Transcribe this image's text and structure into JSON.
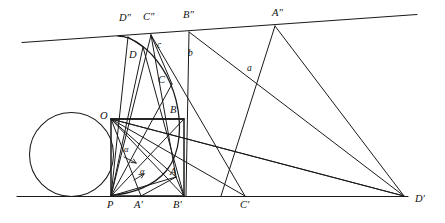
{
  "figure": {
    "type": "geometric-construction",
    "width": 445,
    "height": 223,
    "stroke_color": "#1a1a1a",
    "background_color": "#ffffff"
  },
  "labels": {
    "points": [
      {
        "id": "O",
        "text": "O",
        "x": 100,
        "y": 111
      },
      {
        "id": "P",
        "text": "P",
        "x": 107,
        "y": 200
      },
      {
        "id": "A",
        "text": "A",
        "x": 170,
        "y": 167
      },
      {
        "id": "B",
        "text": "B",
        "x": 170,
        "y": 105
      },
      {
        "id": "C",
        "text": "C",
        "x": 158,
        "y": 75
      },
      {
        "id": "D",
        "text": "D",
        "x": 129,
        "y": 50
      },
      {
        "id": "Ap",
        "text": "A′",
        "x": 134,
        "y": 200
      },
      {
        "id": "Bp",
        "text": "B′",
        "x": 173,
        "y": 200
      },
      {
        "id": "Cp",
        "text": "C′",
        "x": 240,
        "y": 200
      },
      {
        "id": "Dp",
        "text": "D′",
        "x": 415,
        "y": 194
      },
      {
        "id": "App",
        "text": "A″",
        "x": 272,
        "y": 8
      },
      {
        "id": "Bpp",
        "text": "B″",
        "x": 183,
        "y": 10
      },
      {
        "id": "Cpp",
        "text": "C″",
        "x": 143,
        "y": 12
      },
      {
        "id": "Dpp",
        "text": "D″",
        "x": 119,
        "y": 13
      }
    ],
    "sides": [
      {
        "id": "a",
        "text": "a",
        "x": 247,
        "y": 64
      },
      {
        "id": "b",
        "text": "b",
        "x": 188,
        "y": 49
      },
      {
        "id": "c",
        "text": "c",
        "x": 157,
        "y": 41
      }
    ],
    "angles": [
      {
        "id": "alpha-upper",
        "text": "α",
        "x": 124,
        "y": 145
      },
      {
        "id": "alpha-lower",
        "text": "α",
        "x": 140,
        "y": 167
      }
    ]
  },
  "geometry": {
    "baseline": {
      "x1": 17,
      "y1": 196.5,
      "x2": 408,
      "y2": 196.5
    },
    "tangent_line": {
      "x1": 22,
      "y1": 42.5,
      "x2": 417,
      "y2": 14.5
    },
    "circle": {
      "cx": 71.5,
      "cy": 154.5,
      "r": 42
    },
    "vertices": {
      "O": [
        111,
        119
      ],
      "P": [
        111,
        196
      ],
      "A": [
        176,
        177
      ],
      "B": [
        184,
        119
      ],
      "C": [
        172,
        84
      ],
      "D": [
        143,
        47
      ],
      "Ap": [
        141,
        196
      ],
      "Bp": [
        184,
        196
      ],
      "Cp": [
        245,
        196
      ],
      "Dp": [
        404,
        196
      ],
      "App": [
        275,
        26
      ],
      "Bpp": [
        189,
        32
      ],
      "Cpp": [
        151,
        35
      ],
      "Dpp": [
        128,
        37
      ]
    }
  }
}
